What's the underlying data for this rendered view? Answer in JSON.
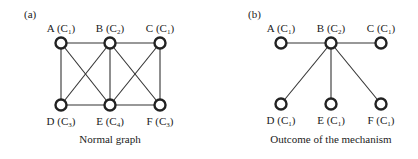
{
  "panels": [
    {
      "tag": "(a)",
      "caption": "Normal graph",
      "nodes": [
        {
          "id": "A",
          "color": "1",
          "x": 61,
          "y": 43
        },
        {
          "id": "B",
          "color": "2",
          "x": 110,
          "y": 43
        },
        {
          "id": "C",
          "color": "1",
          "x": 160,
          "y": 43
        },
        {
          "id": "D",
          "color": "3",
          "x": 61,
          "y": 105
        },
        {
          "id": "E",
          "color": "4",
          "x": 110,
          "y": 105
        },
        {
          "id": "F",
          "color": "3",
          "x": 160,
          "y": 105
        }
      ],
      "edges": [
        [
          "A",
          "B"
        ],
        [
          "B",
          "C"
        ],
        [
          "A",
          "D"
        ],
        [
          "A",
          "E"
        ],
        [
          "B",
          "D"
        ],
        [
          "B",
          "E"
        ],
        [
          "B",
          "F"
        ],
        [
          "C",
          "E"
        ],
        [
          "C",
          "F"
        ],
        [
          "D",
          "E"
        ],
        [
          "E",
          "F"
        ]
      ]
    },
    {
      "tag": "(b)",
      "caption": "Outcome of the mechanism",
      "nodes": [
        {
          "id": "A",
          "color": "1",
          "x": 281,
          "y": 43
        },
        {
          "id": "B",
          "color": "2",
          "x": 331,
          "y": 43
        },
        {
          "id": "C",
          "color": "1",
          "x": 381,
          "y": 43
        },
        {
          "id": "D",
          "color": "1",
          "x": 281,
          "y": 104
        },
        {
          "id": "E",
          "color": "1",
          "x": 331,
          "y": 104
        },
        {
          "id": "F",
          "color": "1",
          "x": 381,
          "y": 104
        }
      ],
      "edges": [
        [
          "A",
          "B"
        ],
        [
          "B",
          "C"
        ],
        [
          "B",
          "D"
        ],
        [
          "B",
          "E"
        ],
        [
          "B",
          "F"
        ]
      ]
    }
  ]
}
